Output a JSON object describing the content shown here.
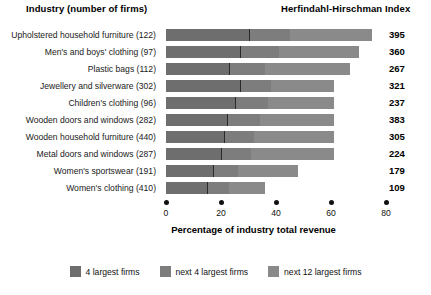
{
  "header": {
    "left_title": "Industry (number of firms)",
    "right_title": "Herfindahl-Hirschman Index"
  },
  "axis": {
    "xlabel": "Percentage of industry total revenue",
    "ticks": [
      "0",
      "20",
      "40",
      "60",
      "80"
    ]
  },
  "legend": [
    {
      "label": "4 largest firms",
      "color": "#6e6e6e"
    },
    {
      "label": "next 4 largest firms",
      "color": "#7d7d7d"
    },
    {
      "label": "next 12 largest firms",
      "color": "#8a8a8a"
    }
  ],
  "chart_data": {
    "type": "bar",
    "orientation": "horizontal",
    "stacked": true,
    "title": "",
    "xlabel": "Percentage of industry total revenue",
    "ylabel": "Industry (number of firms)",
    "xlim": [
      0,
      80
    ],
    "xticks": [
      0,
      20,
      40,
      60,
      80
    ],
    "grid": false,
    "legend_position": "bottom",
    "categories": [
      "Upholstered household furniture (122)",
      "Men's and boys' clothing (97)",
      "Plastic bags (112)",
      "Jewellery and silverware (302)",
      "Children's clothing (96)",
      "Wooden doors and windows (282)",
      "Wooden household furniture (440)",
      "Metal doors and windows (287)",
      "Women's sportswear (191)",
      "Women's clothing (410)"
    ],
    "series": [
      {
        "name": "4 largest firms",
        "values": [
          30,
          27,
          23,
          27,
          25,
          22,
          21,
          20,
          17,
          15
        ]
      },
      {
        "name": "next 4 largest firms",
        "values": [
          15,
          14,
          13,
          11,
          12,
          12,
          11,
          11,
          9,
          8
        ]
      },
      {
        "name": "next 12 largest firms",
        "values": [
          30,
          29,
          31,
          23,
          24,
          27,
          29,
          30,
          22,
          13
        ]
      }
    ],
    "totals": [
      75,
      70,
      67,
      61,
      61,
      61,
      61,
      61,
      48,
      36
    ],
    "annotation_column": {
      "name": "Herfindahl-Hirschman Index",
      "values": [
        395,
        360,
        267,
        321,
        237,
        383,
        305,
        224,
        179,
        109
      ]
    }
  }
}
